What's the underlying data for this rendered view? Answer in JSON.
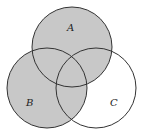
{
  "diagram": {
    "type": "venn",
    "shaded_region": "A ∪ B",
    "colors": {
      "shade": "#c8c8c8",
      "stroke": "#333333",
      "background": "#ffffff"
    },
    "sets": [
      {
        "label": "A",
        "cx": 72,
        "cy": 47,
        "r": 40,
        "shaded": true
      },
      {
        "label": "B",
        "cx": 47,
        "cy": 88,
        "r": 40,
        "shaded": true
      },
      {
        "label": "C",
        "cx": 96,
        "cy": 88,
        "r": 40,
        "shaded": false
      }
    ]
  }
}
